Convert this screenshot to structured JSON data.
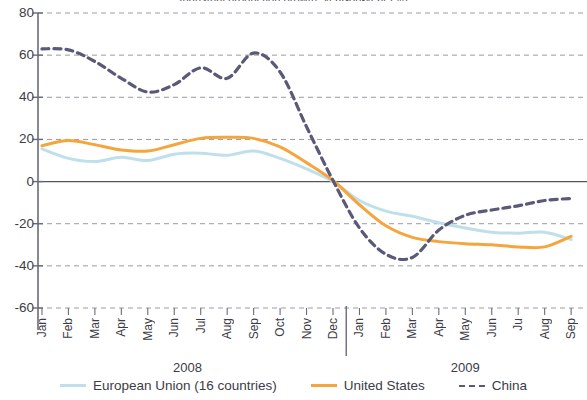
{
  "title": "Industrial production growth, year-on-year (%)",
  "chart_data": {
    "type": "line",
    "title": "Industrial production growth, year-on-year (%)",
    "xlabel": "",
    "ylabel": "",
    "ylim": [
      -60,
      80
    ],
    "yticks": [
      80,
      60,
      40,
      20,
      0,
      -20,
      -40,
      -60
    ],
    "grid": true,
    "legend_position": "bottom",
    "x": [
      "Jan",
      "Feb",
      "Mar",
      "Apr",
      "May",
      "Jun",
      "Jul",
      "Aug",
      "Sep",
      "Oct",
      "Nov",
      "Dec",
      "Jan",
      "Feb",
      "Mar",
      "Apr",
      "May",
      "Jun",
      "Ju",
      "Aug",
      "Sep"
    ],
    "year_groups": [
      {
        "label": "2008",
        "start_index": 0,
        "end_index": 11
      },
      {
        "label": "2009",
        "start_index": 12,
        "end_index": 20
      }
    ],
    "series": [
      {
        "name": "European Union (16 countries)",
        "color": "#bfe0ea",
        "style": "solid",
        "values": [
          15.5,
          11.0,
          9.5,
          11.5,
          10.0,
          13.0,
          13.5,
          12.5,
          14.5,
          11.0,
          6.0,
          0.0,
          -9.0,
          -14.0,
          -16.5,
          -19.5,
          -22.0,
          -24.0,
          -24.5,
          -24.0,
          -27.5
        ]
      },
      {
        "name": "United States",
        "color": "#f6a43c",
        "style": "solid",
        "values": [
          17.0,
          19.5,
          17.5,
          15.0,
          14.5,
          17.5,
          20.5,
          21.0,
          20.5,
          16.5,
          9.0,
          0.5,
          -11.0,
          -21.0,
          -26.5,
          -28.5,
          -29.5,
          -30.0,
          -31.0,
          -31.0,
          -26.0
        ]
      },
      {
        "name": "China",
        "color": "#5a5a78",
        "style": "dashed",
        "values": [
          63.0,
          62.5,
          57.0,
          49.0,
          42.5,
          46.0,
          54.0,
          49.0,
          61.0,
          52.0,
          26.0,
          0.5,
          -22.0,
          -34.5,
          -36.0,
          -23.0,
          -16.0,
          -13.5,
          -11.5,
          -9.0,
          -8.0
        ]
      }
    ]
  },
  "legend": [
    {
      "label": "European Union (16 countries)",
      "color": "#bfe0ea",
      "style": "solid"
    },
    {
      "label": "United States",
      "color": "#f6a43c",
      "style": "solid"
    },
    {
      "label": "China",
      "color": "#5a5a78",
      "style": "dashed"
    }
  ]
}
